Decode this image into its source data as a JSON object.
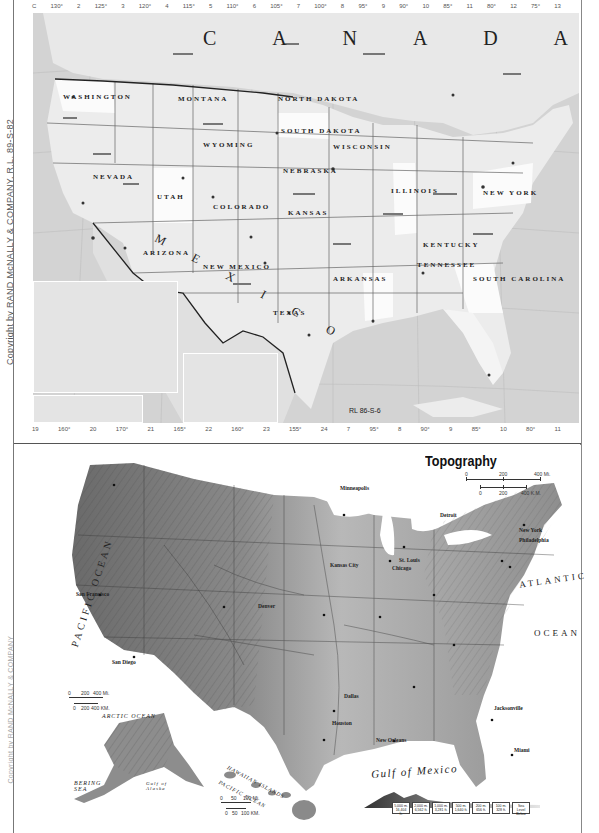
{
  "page": {
    "copyright_text": "Copyright by RAND McNALLY & COMPANY, R.L. 89-S-82",
    "copyright_lower": "Copyright by RAND McNALLY & COMPANY"
  },
  "political_map": {
    "ref_code": "RL 86-S-6",
    "grid_top": [
      "C",
      "130°",
      "2",
      "125°",
      "3",
      "120°",
      "4",
      "115°",
      "5",
      "110°",
      "6",
      "105°",
      "7",
      "100°",
      "8",
      "95°",
      "9",
      "90°",
      "10",
      "85°",
      "11",
      "80°",
      "12",
      "75°",
      "13"
    ],
    "grid_bottom": [
      "19",
      "160°",
      "20",
      "170°",
      "21",
      "165°",
      "22",
      "160°",
      "23",
      "155°",
      "24",
      "7",
      "95°",
      "8",
      "90°",
      "9",
      "85°",
      "10",
      "80°",
      "11"
    ],
    "country_labels": {
      "canada": "C A N A D A",
      "mexico": "M E X I C O",
      "cuba": "C U B A"
    },
    "provinces": [
      "BRITISH COLUMBIA",
      "ALBERTA",
      "SASKATCHEWAN",
      "MANITOBA",
      "ONTARIO",
      "QUEBEC",
      "N.B."
    ],
    "states": [
      "WASHINGTON",
      "OREGON",
      "IDAHO",
      "MONTANA",
      "NORTH DAKOTA",
      "SOUTH DAKOTA",
      "WYOMING",
      "NEBRASKA",
      "NEVADA",
      "UTAH",
      "COLORADO",
      "KANSAS",
      "CALIFORNIA",
      "ARIZONA",
      "NEW MEXICO",
      "OKLAHOMA",
      "TEXAS",
      "MINNESOTA",
      "WISCONSIN",
      "ILLINOIS",
      "MISSOURI",
      "ARKANSAS",
      "LOUISIANA",
      "KENTUCKY",
      "TENNESSEE",
      "MISSISSIPPI",
      "ALABAMA",
      "GEORGIA",
      "FLORIDA",
      "NORTH CAROLINA",
      "SOUTH CAROLINA",
      "VIRGINIA",
      "NEW YORK",
      "PENNSYLVANIA",
      "MAINE",
      "MICHIGAN",
      "OHIO",
      "INDIANA"
    ],
    "regions": [
      "GREAT BASIN",
      "SONORA",
      "CHIHUAHUA",
      "COAHUILA"
    ],
    "cities": [
      "Winnipeg",
      "Calgary",
      "Regina",
      "Montréal",
      "Québec",
      "Ottawa",
      "Toronto",
      "Chicago",
      "New York",
      "Los Angeles",
      "San Diego",
      "Phoenix",
      "Tucson",
      "Denver",
      "Salt Lake City",
      "Minneapolis",
      "St. Paul",
      "Ft. Worth",
      "San Antonio",
      "Houston",
      "New Orleans",
      "Atlanta",
      "Miami",
      "St. Petersburg",
      "Oklahoma City",
      "Kansas City",
      "Havana"
    ],
    "insets": {
      "alaska": {
        "labels": [
          "ALASKA",
          "YUKON",
          "CANADA",
          "BRITISH COLUMBIA"
        ]
      },
      "aleutian": {
        "label": "ALEUTIAN ISLANDS"
      },
      "hawaii": {
        "title": "Same Scale as Main Map",
        "label": "HAWAIIAN ISLANDS"
      }
    }
  },
  "topography_map": {
    "title": "Topography",
    "scale_main": {
      "miles": [
        "0",
        "200",
        "400 Mi."
      ],
      "km": [
        "0",
        "200",
        "400 K.M."
      ]
    },
    "scale_alaska": {
      "miles": [
        "0",
        "200",
        "400 Mi."
      ],
      "km": [
        "0",
        "200",
        "400 KM."
      ]
    },
    "scale_hawaii": {
      "miles": [
        "0",
        "50",
        "100 Mi."
      ],
      "km": [
        "0",
        "50",
        "100 KM."
      ]
    },
    "water_labels": {
      "pacific_vertical": "PACIFIC   OCEAN",
      "atlantic": "ATLANTIC",
      "ocean": "OCEAN",
      "gulf_of_mexico": "Gulf of Mexico",
      "arctic_ocean": "ARCTIC OCEAN",
      "bering_sea": "BERING SEA",
      "gulf_of_alaska": "Gulf of Alaska",
      "pacific_ocean_hawaii": "PACIFIC OCEAN",
      "hawaiian_islands": "HAWAIIAN ISLANDS"
    },
    "physical_features": [
      "COLUMBIA PLATEAU",
      "GREAT BASIN",
      "COLORADO PLATEAU",
      "GREAT PLAINS",
      "LLANO ESTACADO",
      "EDWARDS PLATEAU",
      "OZARK PLATEAU",
      "APPALACHIAN MOUNTAINS",
      "COASTAL PLAIN",
      "ROCKY MOUNTAINS",
      "BROOKS RANGE",
      "ALEXANDER ARCHIPELAGO",
      "Mississippi Delta",
      "Long Island",
      "Chesapeake Bay",
      "FLORIDA KEYS",
      "Okeechobee",
      "Everglades",
      "SANTA BARBARA IS.",
      "Kodiak I.",
      "St. Lawrence I."
    ],
    "cities": [
      "Seattle",
      "San Francisco",
      "Los Angeles",
      "San Diego",
      "Phoenix",
      "Denver",
      "Salt Lake City",
      "Minneapolis",
      "Milwaukee",
      "Chicago",
      "Detroit",
      "Cleveland",
      "Pittsburgh",
      "New York",
      "Philadelphia",
      "Boston",
      "Kansas City",
      "St. Louis",
      "Indianapolis",
      "Memphis",
      "Atlanta",
      "Dallas",
      "Houston",
      "New Orleans",
      "Jacksonville",
      "Miami",
      "Honolulu",
      "Kauai",
      "Oahu",
      "Molokai",
      "Maui",
      "Hawaii"
    ],
    "elevation_legend": {
      "cells": [
        {
          "m": "5,000 m.",
          "ft": "16,404 ft."
        },
        {
          "m": "2,000 m.",
          "ft": "6,562 ft."
        },
        {
          "m": "1,000 m.",
          "ft": "3,281 ft."
        },
        {
          "m": "500 m.",
          "ft": "1,640 ft."
        },
        {
          "m": "200 m.",
          "ft": "656 ft."
        },
        {
          "m": "100 m.",
          "ft": "328 ft."
        },
        {
          "m": "Sea Level",
          "ft": "Below"
        }
      ]
    }
  }
}
